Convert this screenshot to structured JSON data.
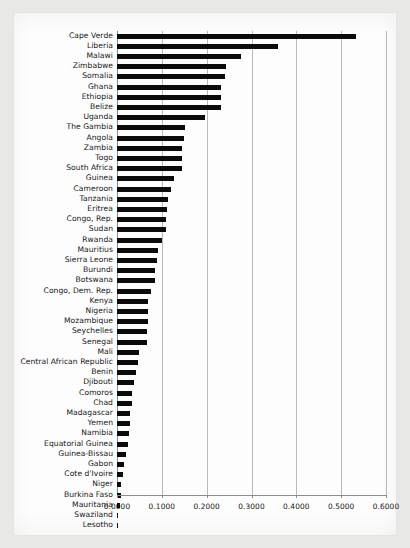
{
  "chart_data": {
    "type": "bar",
    "orientation": "horizontal",
    "title": "",
    "subtitle": "",
    "xlabel": "",
    "ylabel": "",
    "xlim": [
      0.0,
      0.6
    ],
    "ylim": null,
    "grid": true,
    "legend": null,
    "xticks": [
      "0.0000",
      "0.1000",
      "0.2000",
      "0.3000",
      "0.4000",
      "0.5000",
      "0.6000"
    ],
    "xtick_values": [
      0.0,
      0.1,
      0.2,
      0.3,
      0.4,
      0.5,
      0.6
    ],
    "series_name": "",
    "bar_color": "#0b0b0b",
    "categories": [
      "Cape Verde",
      "Liberia",
      "Malawi",
      "Zimbabwe",
      "Somalia",
      "Ghana",
      "Ethiopia",
      "Belize",
      "Uganda",
      "The Gambia",
      "Angola",
      "Zambia",
      "Togo",
      "South Africa",
      "Guinea",
      "Cameroon",
      "Tanzania",
      "Eritrea",
      "Congo, Rep.",
      "Sudan",
      "Rwanda",
      "Mauritius",
      "Sierra Leone",
      "Burundi",
      "Botswana",
      "Congo, Dem. Rep.",
      "Kenya",
      "Nigeria",
      "Mozambique",
      "Seychelles",
      "Senegal",
      "Mali",
      "Central African Republic",
      "Benin",
      "Djibouti",
      "Comoros",
      "Chad",
      "Madagascar",
      "Yemen",
      "Namibia",
      "Equatorial Guinea",
      "Guinea-Bissau",
      "Gabon",
      "Cote d'Ivoire",
      "Niger",
      "Burkina Faso",
      "Mauritania",
      "Swaziland",
      "Lesotho"
    ],
    "values": [
      0.533,
      0.36,
      0.277,
      0.243,
      0.241,
      0.232,
      0.231,
      0.231,
      0.197,
      0.152,
      0.15,
      0.146,
      0.144,
      0.144,
      0.128,
      0.12,
      0.113,
      0.112,
      0.11,
      0.109,
      0.1,
      0.092,
      0.09,
      0.085,
      0.084,
      0.076,
      0.07,
      0.069,
      0.069,
      0.067,
      0.066,
      0.05,
      0.047,
      0.043,
      0.038,
      0.034,
      0.033,
      0.029,
      0.028,
      0.027,
      0.025,
      0.019,
      0.016,
      0.013,
      0.009,
      0.008,
      0.007,
      0.002,
      0.001
    ]
  }
}
